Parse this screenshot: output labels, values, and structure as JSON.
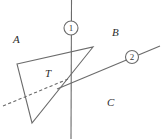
{
  "figure": {
    "title": "",
    "width": 161,
    "height": 139,
    "background_color": "#ffffff",
    "stroke_color": "#6b6b6b",
    "text_color": "#2b2b2b"
  },
  "region_labels": [
    {
      "id": "A",
      "text": "A",
      "x": 13,
      "y": 34
    },
    {
      "id": "B",
      "text": "B",
      "x": 112,
      "y": 27
    },
    {
      "id": "C",
      "text": "C",
      "x": 107,
      "y": 97
    },
    {
      "id": "T",
      "text": "T",
      "x": 45,
      "y": 68
    }
  ],
  "line_badges": [
    {
      "id": "1",
      "text": "1",
      "cx": 71,
      "cy": 28,
      "r": 7
    },
    {
      "id": "2",
      "text": "2",
      "cx": 132,
      "cy": 57,
      "r": 6.5
    }
  ],
  "geometry": {
    "line1": {
      "x1": 71.5,
      "y1": 0,
      "x2": 71,
      "y2": 139
    },
    "line2": {
      "x1": 57,
      "y1": 89,
      "x2": 160,
      "y2": 46
    },
    "triangle": {
      "points": "17,64 93,47 32,123",
      "vertices": [
        {
          "x": 17,
          "y": 64
        },
        {
          "x": 93,
          "y": 47
        },
        {
          "x": 32,
          "y": 123
        }
      ]
    },
    "dashed_line": {
      "x1": 3,
      "y1": 106,
      "x2": 68,
      "y2": 79
    }
  }
}
